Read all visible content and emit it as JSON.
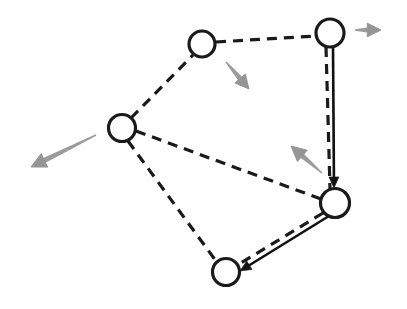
{
  "figure": {
    "title": "",
    "background_color": "#ffffff",
    "width": 407,
    "height": 309
  },
  "style": {
    "node_stroke_color": "#1a1a1a",
    "node_fill_color": "#ffffff",
    "node_stroke_width": 3.2,
    "dashed_edge_color": "#1a1a1a",
    "dashed_edge_width": 3.2,
    "dash_pattern": "10,7",
    "solid_edge_color": "#111111",
    "solid_edge_width": 2.6,
    "vector_arrow_color": "#8a8a8a",
    "vector_arrow_width": 2.4
  },
  "nodes": [
    {
      "id": "n-top-left",
      "label": "",
      "cx": 202,
      "cy": 44,
      "r": 13
    },
    {
      "id": "n-top-right",
      "label": "",
      "cx": 330,
      "cy": 33,
      "r": 14
    },
    {
      "id": "n-left",
      "label": "",
      "cx": 122,
      "cy": 128,
      "r": 13.5
    },
    {
      "id": "n-right",
      "label": "",
      "cx": 335,
      "cy": 203,
      "r": 14.5
    },
    {
      "id": "n-bottom",
      "label": "",
      "cx": 226,
      "cy": 272,
      "r": 13.5
    }
  ],
  "dashed_edges": [
    {
      "id": "e-tl-tr",
      "from": "n-top-left",
      "to": "n-top-right",
      "x1": 216,
      "y1": 42,
      "x2": 316,
      "y2": 36
    },
    {
      "id": "e-left-tl",
      "from": "n-left",
      "to": "n-top-left",
      "x1": 131,
      "y1": 118,
      "x2": 193,
      "y2": 55
    },
    {
      "id": "e-left-right",
      "from": "n-left",
      "to": "n-right",
      "x1": 136,
      "y1": 131,
      "x2": 321,
      "y2": 199
    },
    {
      "id": "e-left-bottom",
      "from": "n-left",
      "to": "n-bottom",
      "x1": 128,
      "y1": 141,
      "x2": 216,
      "y2": 261
    },
    {
      "id": "e-tr-right",
      "from": "n-top-right",
      "to": "n-right",
      "x1": 326,
      "y1": 47,
      "x2": 330,
      "y2": 189
    },
    {
      "id": "e-right-bottom",
      "from": "n-right",
      "to": "n-bottom",
      "x1": 323,
      "y1": 213,
      "x2": 236,
      "y2": 266
    }
  ],
  "solid_arrows": [
    {
      "id": "a-tr-right",
      "from": "n-top-right",
      "to": "n-right",
      "x1": 333,
      "y1": 47,
      "x2": 334,
      "y2": 188,
      "head_size": 11
    },
    {
      "id": "a-right-bottom",
      "from": "n-right",
      "to": "n-bottom",
      "x1": 329,
      "y1": 216,
      "x2": 240,
      "y2": 271,
      "head_size": 11
    }
  ],
  "vector_arrows": [
    {
      "id": "v-top-right",
      "attached_to": "n-top-right",
      "direction": "right",
      "x1": 355,
      "y1": 30,
      "x2": 381,
      "y2": 30,
      "head_size": 11
    },
    {
      "id": "v-top-left",
      "attached_to": "n-top-left",
      "direction": "down-right",
      "x1": 226,
      "y1": 62,
      "x2": 249,
      "y2": 89,
      "head_size": 11
    },
    {
      "id": "v-right",
      "attached_to": "n-right",
      "direction": "up-left",
      "x1": 322,
      "y1": 173,
      "x2": 291,
      "y2": 146,
      "head_size": 12
    },
    {
      "id": "v-left",
      "attached_to": "n-left",
      "direction": "down-left",
      "x1": 96,
      "y1": 135,
      "x2": 31,
      "y2": 167,
      "head_size": 12
    }
  ],
  "labels": []
}
